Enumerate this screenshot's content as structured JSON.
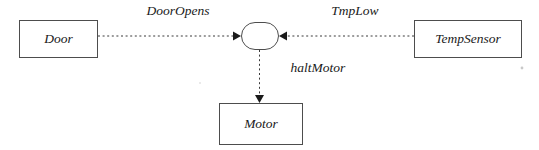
{
  "diagram": {
    "background_color": "#ffffff",
    "line_color": "#4d4d4d",
    "text_color": "#1a1a1a",
    "nodes": [
      {
        "id": "door",
        "label": "Door",
        "shape": "rectangle"
      },
      {
        "id": "junction",
        "label": "",
        "shape": "rounded-node"
      },
      {
        "id": "tempsensor",
        "label": "TempSensor",
        "shape": "rectangle"
      },
      {
        "id": "motor",
        "label": "Motor",
        "shape": "rectangle"
      }
    ],
    "edges": [
      {
        "id": "door-to-junction",
        "label": "DoorOpens",
        "from": "door",
        "to": "junction",
        "style": "dashed",
        "arrow": "right"
      },
      {
        "id": "tempsensor-to-junction",
        "label": "TmpLow",
        "from": "tempsensor",
        "to": "junction",
        "style": "dashed",
        "arrow": "left"
      },
      {
        "id": "junction-to-motor",
        "label": "haltMotor",
        "from": "junction",
        "to": "motor",
        "style": "dashed",
        "arrow": "down"
      }
    ]
  }
}
